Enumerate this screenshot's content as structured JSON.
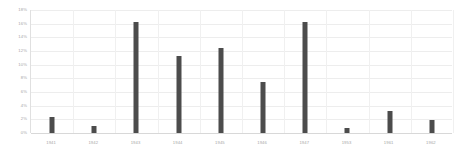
{
  "chart_data": {
    "type": "bar",
    "title": "",
    "subtitle": "",
    "xlabel": "",
    "ylabel": "",
    "categories": [
      "1941",
      "1942",
      "1943",
      "1944",
      "1945",
      "1946",
      "1947",
      "1953",
      "1961",
      "1962"
    ],
    "values": [
      2.3,
      1.0,
      16.3,
      11.2,
      12.5,
      7.4,
      16.2,
      0.7,
      3.2,
      1.9
    ],
    "value_unit": "%",
    "ylim": [
      0,
      18
    ],
    "ytick_values": [
      0,
      2,
      4,
      6,
      8,
      10,
      12,
      14,
      16,
      18
    ],
    "ytick_labels": [
      "0%",
      "2%",
      "4%",
      "6%",
      "8%",
      "10%",
      "12%",
      "14%",
      "16%",
      "18%"
    ],
    "grid": true,
    "grid_axis": "both",
    "legend": false,
    "legend_position": "none",
    "series": [
      {
        "name": "",
        "values": [
          2.3,
          1.0,
          16.3,
          11.2,
          12.5,
          7.4,
          16.2,
          0.7,
          3.2,
          1.9
        ]
      }
    ]
  },
  "style": {
    "bar_color": "#4c4c4c",
    "gridline_color": "#ededed",
    "axis_color": "#d8d8d8",
    "tick_label_color": "#a6a6a6",
    "background": "#ffffff"
  }
}
